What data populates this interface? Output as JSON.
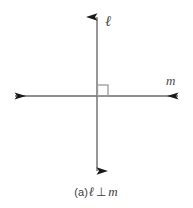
{
  "figure": {
    "background_color": "#ffffff",
    "line_color": "#6b6b6b",
    "arrow_color": "#1a1a1a",
    "mark_color": "#8a8a8a",
    "text_color": "#3d3d3d",
    "width": 193,
    "height": 208
  },
  "labels": {
    "vertical_line": "ℓ",
    "horizontal_line": "m"
  },
  "caption": {
    "full": "(a) ℓ ⊥ m",
    "prefix": "(a)",
    "first_line": "ℓ",
    "relation_symbol": "⊥",
    "second_line": "m"
  },
  "elements": {
    "vertical_line_name": "line-l",
    "horizontal_line_name": "line-m",
    "right_angle_mark": "right-angle-square"
  },
  "diagram_data": {
    "type": "geometry",
    "shapes": [
      {
        "name": "line-l",
        "kind": "line",
        "label": "ℓ",
        "orientation": "vertical",
        "x1": 97,
        "y1": 16,
        "x2": 97,
        "y2": 172,
        "arrow_start": true,
        "arrow_end": true
      },
      {
        "name": "line-m",
        "kind": "line",
        "label": "m",
        "orientation": "horizontal",
        "x1": 14,
        "y1": 96,
        "x2": 179,
        "y2": 96,
        "arrow_start": true,
        "arrow_end": true
      },
      {
        "name": "right-angle-square",
        "kind": "square-mark",
        "x": 97,
        "y": 85,
        "size": 11,
        "quadrant": "upper-right"
      }
    ],
    "intersection": {
      "x": 97,
      "y": 96
    },
    "relation": "perpendicular"
  }
}
